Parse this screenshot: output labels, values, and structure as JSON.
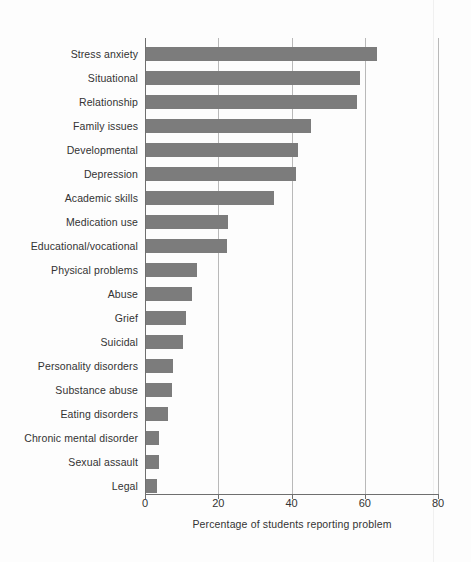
{
  "chart_data": {
    "type": "bar",
    "orientation": "horizontal",
    "title": "",
    "xlabel": "Percentage of students reporting problem",
    "ylabel": "",
    "xlim": [
      0,
      80
    ],
    "xticks": [
      0,
      20,
      40,
      60,
      80
    ],
    "xtick_labels": [
      "0",
      "20",
      "40",
      "60",
      "80"
    ],
    "grid": "vertical gridlines at each x tick",
    "legend": "none",
    "bar_color": "#7c7c7c",
    "categories": [
      "Stress anxiety",
      "Situational",
      "Relationship",
      "Family issues",
      "Developmental",
      "Depression",
      "Academic skills",
      "Medication use",
      "Educational/vocational",
      "Physical problems",
      "Abuse",
      "Grief",
      "Suicidal",
      "Personality disorders",
      "Substance abuse",
      "Eating disorders",
      "Chronic mental disorder",
      "Sexual assault",
      "Legal"
    ],
    "values": [
      63,
      58.5,
      57.5,
      45,
      41.5,
      41,
      35,
      22.5,
      22,
      14,
      12.5,
      11,
      10,
      7.5,
      7,
      6,
      3.5,
      3.5,
      3
    ]
  },
  "axis": {
    "x_title": "Percentage of students reporting problem",
    "tick_0": "0",
    "tick_20": "20",
    "tick_40": "40",
    "tick_60": "60",
    "tick_80": "80"
  },
  "labels": {
    "row_0": "Stress anxiety",
    "row_1": "Situational",
    "row_2": "Relationship",
    "row_3": "Family issues",
    "row_4": "Developmental",
    "row_5": "Depression",
    "row_6": "Academic skills",
    "row_7": "Medication use",
    "row_8": "Educational/vocational",
    "row_9": "Physical problems",
    "row_10": "Abuse",
    "row_11": "Grief",
    "row_12": "Suicidal",
    "row_13": "Personality disorders",
    "row_14": "Substance abuse",
    "row_15": "Eating disorders",
    "row_16": "Chronic mental disorder",
    "row_17": "Sexual assault",
    "row_18": "Legal"
  }
}
